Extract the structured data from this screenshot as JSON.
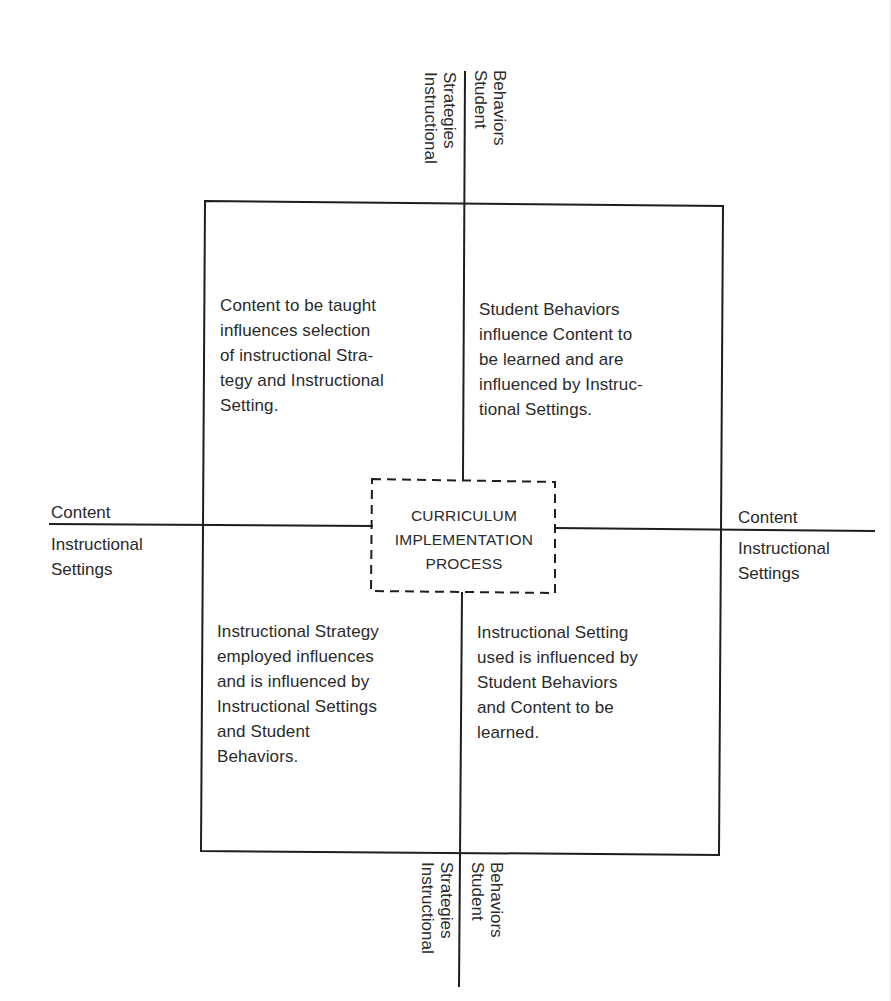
{
  "diagram": {
    "center_label": "CURRICULUM\nIMPLEMENTATION\nPROCESS",
    "axes": {
      "top": {
        "left_label": "Instructional\nStrategies",
        "right_label": "Student\nBehaviors"
      },
      "bottom": {
        "left_label": "Instructional\nStrategies",
        "right_label": "Student\nBehaviors"
      },
      "left": {
        "upper_label": "Content",
        "lower_label": "Instructional\nSettings"
      },
      "right": {
        "upper_label": "Content",
        "lower_label": "Instructional\nSettings"
      }
    },
    "quadrants": {
      "top_left": "Content to be taught\ninfluences selection\nof instructional Stra-\ntegy and Instructional\nSetting.",
      "top_right": "Student Behaviors\ninfluence Content to\nbe learned and are\ninfluenced by Instruc-\ntional Settings.",
      "bottom_left": "Instructional Strategy\nemployed influences\nand is influenced by\nInstructional Settings\nand Student\nBehaviors.",
      "bottom_right": "Instructional Setting\nused is influenced by\nStudent Behaviors\nand Content to be\nlearned."
    }
  }
}
